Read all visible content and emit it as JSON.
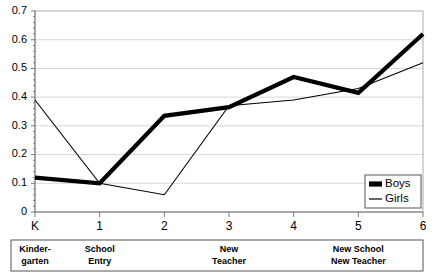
{
  "chart_data": {
    "type": "line",
    "title": "",
    "xlabel": "",
    "ylabel": "",
    "x": [
      "K",
      "1",
      "2",
      "3",
      "4",
      "5",
      "6"
    ],
    "xtick_labels": [
      "K",
      "1",
      "2",
      "3",
      "4",
      "5",
      "6"
    ],
    "ytick_labels": [
      "0",
      "0.1",
      "0.2",
      "0.3",
      "0.4",
      "0.5",
      "0.6",
      "0.7"
    ],
    "ylim": [
      0,
      0.7
    ],
    "ystep": 0.1,
    "grid": "horizontal",
    "legend_position": "bottom-right",
    "series": [
      {
        "name": "Boys",
        "style": "thick-black",
        "values": [
          0.12,
          0.1,
          0.335,
          0.365,
          0.47,
          0.415,
          0.62
        ]
      },
      {
        "name": "Girls",
        "style": "thin-black",
        "values": [
          0.39,
          0.1,
          0.06,
          0.37,
          0.39,
          0.43,
          0.52
        ]
      }
    ],
    "annotation_band": [
      {
        "label_line1": "Kinder-",
        "label_line2": "garten",
        "center_x": "K"
      },
      {
        "label_line1": "School",
        "label_line2": "Entry",
        "center_x": "1"
      },
      {
        "label_line1": "New",
        "label_line2": "Teacher",
        "center_x": "3"
      },
      {
        "label_line1": "New School",
        "label_line2": "New Teacher",
        "center_x": "5"
      }
    ]
  },
  "legend": {
    "items": [
      {
        "label": "Boys",
        "marker": "thick-line-swatch"
      },
      {
        "label": "Girls",
        "marker": "thin-line-swatch"
      }
    ]
  },
  "colors": {
    "series": "#000000",
    "grid": "#d8d8d8",
    "axis": "#7a7a7a",
    "background": "#ffffff",
    "band_border": "#555555"
  }
}
